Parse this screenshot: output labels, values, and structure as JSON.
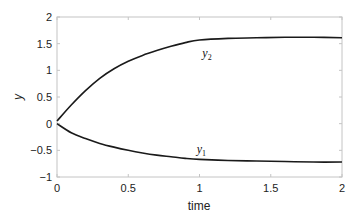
{
  "chart_data": {
    "type": "line",
    "title": "",
    "xlabel": "time",
    "ylabel": "y",
    "xlim": [
      0,
      2
    ],
    "ylim": [
      -1,
      2
    ],
    "grid": false,
    "legend": "none (inline curve labels)",
    "xticks": [
      "0",
      "0.5",
      "1",
      "1.5",
      "2"
    ],
    "yticks": [
      "2",
      "1.5",
      "1",
      "0.5",
      "0",
      "−0.5",
      "−1"
    ],
    "x": [
      0,
      0.1,
      0.2,
      0.3,
      0.4,
      0.5,
      0.6,
      0.7,
      0.8,
      0.9,
      1.0,
      1.2,
      1.4,
      1.6,
      1.8,
      2.0
    ],
    "series": [
      {
        "name": "y1",
        "label_main": "y",
        "label_sub": "1",
        "values": [
          0,
          -0.17,
          -0.28,
          -0.37,
          -0.44,
          -0.5,
          -0.55,
          -0.59,
          -0.62,
          -0.65,
          -0.67,
          -0.69,
          -0.7,
          -0.71,
          -0.72,
          -0.72
        ]
      },
      {
        "name": "y2",
        "label_main": "y",
        "label_sub": "2",
        "values": [
          0.05,
          0.35,
          0.62,
          0.85,
          1.03,
          1.17,
          1.28,
          1.37,
          1.45,
          1.52,
          1.57,
          1.6,
          1.61,
          1.62,
          1.62,
          1.61
        ]
      }
    ],
    "annotations": [
      {
        "text": "y2",
        "x": 1.02,
        "y": 1.25
      },
      {
        "text": "y1",
        "x": 0.98,
        "y": -0.55
      }
    ]
  },
  "colors": {
    "line": "#1a1a1a",
    "axis": "#bdbdbd",
    "text": "#222222"
  }
}
